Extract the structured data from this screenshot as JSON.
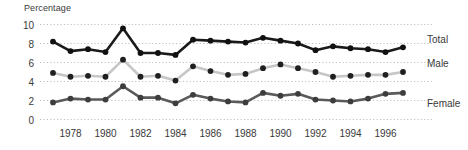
{
  "chart_data": {
    "type": "line",
    "title": "",
    "ylabel": "Percentage",
    "xlabel": "",
    "ylim": [
      0,
      10
    ],
    "xlim": [
      1977,
      1997
    ],
    "grid": true,
    "grid_style": "dotted-horizontal",
    "legend_position": "right-inline",
    "yticks": [
      0,
      2,
      4,
      6,
      8,
      10
    ],
    "ytick_labels": [
      "0",
      "2",
      "4",
      "6",
      "8",
      "10"
    ],
    "xticks": [
      1978,
      1980,
      1982,
      1984,
      1986,
      1988,
      1990,
      1992,
      1994,
      1996
    ],
    "xtick_labels": [
      "1978",
      "1980",
      "1982",
      "1984",
      "1986",
      "1988",
      "1990",
      "1992",
      "1994",
      "1996"
    ],
    "x": [
      1977,
      1978,
      1979,
      1980,
      1981,
      1982,
      1983,
      1984,
      1985,
      1986,
      1987,
      1988,
      1989,
      1990,
      1991,
      1992,
      1993,
      1994,
      1995,
      1996,
      1997
    ],
    "series": [
      {
        "name": "Total",
        "color": "#1a1a1a",
        "values": [
          8.2,
          7.2,
          7.4,
          7.1,
          9.6,
          7.0,
          7.0,
          6.8,
          8.4,
          8.3,
          8.2,
          8.1,
          8.6,
          8.3,
          8.0,
          7.3,
          7.7,
          7.5,
          7.4,
          7.1,
          7.6
        ]
      },
      {
        "name": "Male",
        "color": "#c6c6c6",
        "values": [
          4.9,
          4.5,
          4.6,
          4.5,
          6.3,
          4.5,
          4.6,
          4.1,
          5.6,
          5.1,
          4.7,
          4.8,
          5.4,
          5.8,
          5.4,
          5.0,
          4.5,
          4.6,
          4.7,
          4.7,
          5.0
        ]
      },
      {
        "name": "Female",
        "color": "#5a5a5a",
        "values": [
          1.8,
          2.2,
          2.1,
          2.1,
          3.5,
          2.3,
          2.3,
          1.7,
          2.6,
          2.2,
          1.9,
          1.8,
          2.8,
          2.5,
          2.7,
          2.1,
          2.0,
          1.9,
          2.2,
          2.7,
          2.8
        ]
      }
    ]
  },
  "legend": {
    "items": [
      {
        "label": "Total"
      },
      {
        "label": "Male"
      },
      {
        "label": "Female"
      }
    ]
  },
  "colors": {
    "total": "#1a1a1a",
    "male": "#c6c6c6",
    "female": "#5a5a5a",
    "grid": "#b9b9b9",
    "text": "#3a3a3a",
    "background": "#ffffff"
  }
}
